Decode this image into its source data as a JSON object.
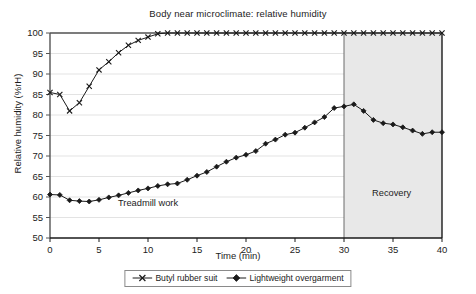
{
  "chart_data": {
    "type": "line",
    "title": "Body near microclimate: relative humidity",
    "xlabel": "Time (min)",
    "ylabel": "Relative humidity (%rH)",
    "xlim": [
      0,
      40
    ],
    "ylim": [
      50,
      100
    ],
    "xticks": [
      0,
      5,
      10,
      15,
      20,
      25,
      30,
      35,
      40
    ],
    "yticks": [
      50,
      55,
      60,
      65,
      70,
      75,
      80,
      85,
      90,
      95,
      100
    ],
    "grid": true,
    "legend_position": "bottom",
    "x": [
      0,
      1,
      2,
      3,
      4,
      5,
      6,
      7,
      8,
      9,
      10,
      11,
      12,
      13,
      14,
      15,
      16,
      17,
      18,
      19,
      20,
      21,
      22,
      23,
      24,
      25,
      26,
      27,
      28,
      29,
      30,
      31,
      32,
      33,
      34,
      35,
      36,
      37,
      38,
      39,
      40
    ],
    "series": [
      {
        "name": "Butyl rubber suit",
        "marker": "x",
        "color": "#1a1a1a",
        "values": [
          85.5,
          85.0,
          81.0,
          83.0,
          87.0,
          91.0,
          93.0,
          95.2,
          97.0,
          98.2,
          99.0,
          99.8,
          100,
          100,
          100,
          100,
          100,
          100,
          100,
          100,
          100,
          100,
          100,
          100,
          100,
          100,
          100,
          100,
          100,
          100,
          100,
          100,
          100,
          100,
          100,
          100,
          100,
          100,
          100,
          100,
          100
        ]
      },
      {
        "name": "Lightweight overgarment",
        "marker": "diamond",
        "color": "#1a1a1a",
        "values": [
          60.6,
          60.5,
          59.2,
          59.0,
          58.9,
          59.3,
          59.9,
          60.4,
          61.0,
          61.6,
          62.1,
          62.7,
          63.1,
          63.3,
          64.2,
          65.2,
          66.1,
          67.4,
          68.6,
          69.6,
          70.3,
          71.2,
          73.0,
          74.0,
          75.2,
          75.7,
          76.9,
          78.2,
          79.5,
          81.7,
          82.1,
          82.6,
          81.0,
          78.8,
          78.0,
          77.7,
          77.0,
          76.2,
          75.4,
          75.8,
          75.8
        ]
      }
    ],
    "annotations": [
      {
        "text": "Treadmill work",
        "x": 8.5,
        "y": 57.5
      },
      {
        "text": "Recovery",
        "x": 33.2,
        "y": 60.5
      }
    ],
    "regions": [
      {
        "label": "Recovery",
        "x_start": 30,
        "x_end": 40,
        "fill": "#e8e8e8"
      }
    ]
  },
  "legend": {
    "items": [
      {
        "label": "Butyl rubber suit",
        "marker": "x"
      },
      {
        "label": "Lightweight overgarment",
        "marker": "diamond"
      }
    ]
  },
  "colors": {
    "axis": "#555555",
    "grid": "#dcdcdc",
    "series": "#1a1a1a",
    "recovery_fill": "#e8e8e8",
    "background": "#ffffff"
  }
}
